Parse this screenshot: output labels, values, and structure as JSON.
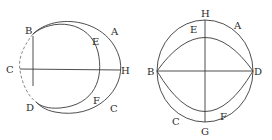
{
  "figures": [
    {
      "name": "left-figure",
      "labels": {
        "B": "B",
        "E": "E",
        "A": "A",
        "C_left": "C",
        "H": "H",
        "D": "D",
        "F": "F",
        "C_bottom": "C"
      }
    },
    {
      "name": "right-figure",
      "labels": {
        "H": "H",
        "A": "A",
        "E": "E",
        "B": "B",
        "D": "D",
        "C": "C",
        "G": "G",
        "F": "F"
      }
    }
  ],
  "colors": {
    "stroke": "#3a3a3a",
    "background": "#ffffff"
  }
}
